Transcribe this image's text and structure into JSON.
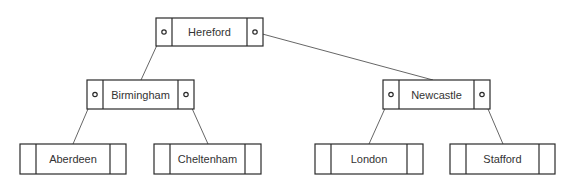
{
  "diagram": {
    "type": "binary-tree",
    "colors": {
      "stroke": "#2a2a2a",
      "edge": "#555555",
      "text": "#333333",
      "background": "#ffffff"
    },
    "nodes": {
      "root": {
        "label": "Hereford",
        "x": 156,
        "y": 18,
        "w": 107,
        "h": 28,
        "has_pointers": true
      },
      "left": {
        "label": "Birmingham",
        "x": 87,
        "y": 80,
        "w": 107,
        "h": 29,
        "has_pointers": true
      },
      "right": {
        "label": "Newcastle",
        "x": 383,
        "y": 80,
        "w": 107,
        "h": 29,
        "has_pointers": true
      },
      "ll": {
        "label": "Aberdeen",
        "x": 20,
        "y": 144,
        "w": 106,
        "h": 30,
        "has_pointers": false
      },
      "lr": {
        "label": "Cheltenham",
        "x": 154,
        "y": 144,
        "w": 107,
        "h": 30,
        "has_pointers": false
      },
      "rl": {
        "label": "London",
        "x": 315,
        "y": 144,
        "w": 108,
        "h": 30,
        "has_pointers": false
      },
      "rr": {
        "label": "Stafford",
        "x": 450,
        "y": 144,
        "w": 105,
        "h": 30,
        "has_pointers": false
      }
    },
    "edges": [
      {
        "from": "root",
        "to": "left",
        "side": "left"
      },
      {
        "from": "root",
        "to": "right",
        "side": "right"
      },
      {
        "from": "left",
        "to": "ll",
        "side": "left"
      },
      {
        "from": "left",
        "to": "lr",
        "side": "right"
      },
      {
        "from": "right",
        "to": "rl",
        "side": "left"
      },
      {
        "from": "right",
        "to": "rr",
        "side": "right"
      }
    ]
  }
}
